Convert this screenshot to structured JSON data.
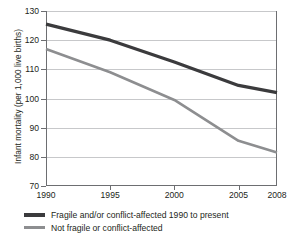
{
  "chart_data": {
    "type": "line",
    "title": "",
    "xlabel": "",
    "ylabel": "Infant mortality (per 1,000 live births)",
    "x": [
      1990,
      1995,
      2000,
      2005,
      2008
    ],
    "xtick_labels": [
      "1990",
      "1995",
      "2000",
      "2005",
      "2008"
    ],
    "ytick_labels": [
      "130",
      "120",
      "110",
      "100",
      "90",
      "80",
      "70"
    ],
    "yticks": [
      130,
      120,
      110,
      100,
      90,
      80,
      70
    ],
    "xlim": [
      1990,
      2008
    ],
    "ylim": [
      70,
      130
    ],
    "grid": "horizontal",
    "legend_position": "below",
    "series": [
      {
        "name": "Fragile and/or conflict-affected 1990 to present",
        "color": "#3b3b3d",
        "width": 3.2,
        "values": [
          125.5,
          120.0,
          112.5,
          104.5,
          102.0
        ]
      },
      {
        "name": "Not fragile or conflict-affected",
        "color": "#8d8e90",
        "width": 2.6,
        "values": [
          117.0,
          109.0,
          99.5,
          85.5,
          81.5
        ]
      }
    ]
  },
  "axis": {
    "y_title": "Infant mortality (per 1,000 live births)"
  },
  "legend": {
    "items": [
      {
        "label": "Fragile and/or conflict-affected 1990 to present"
      },
      {
        "label": "Not fragile or conflict-affected"
      }
    ]
  }
}
